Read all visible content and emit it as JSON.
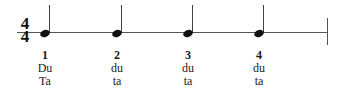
{
  "notation": {
    "time_signature": {
      "top": "4",
      "bottom": "4"
    },
    "note_type": "quarter-note",
    "colors": {
      "ink": "#111111",
      "line": "#555555",
      "background": "#ffffff"
    }
  },
  "beats": [
    {
      "number": "1",
      "syllable_1": "Du",
      "syllable_2": "Ta"
    },
    {
      "number": "2",
      "syllable_1": "du",
      "syllable_2": "ta"
    },
    {
      "number": "3",
      "syllable_1": "du",
      "syllable_2": "ta"
    },
    {
      "number": "4",
      "syllable_1": "du",
      "syllable_2": "ta"
    }
  ]
}
